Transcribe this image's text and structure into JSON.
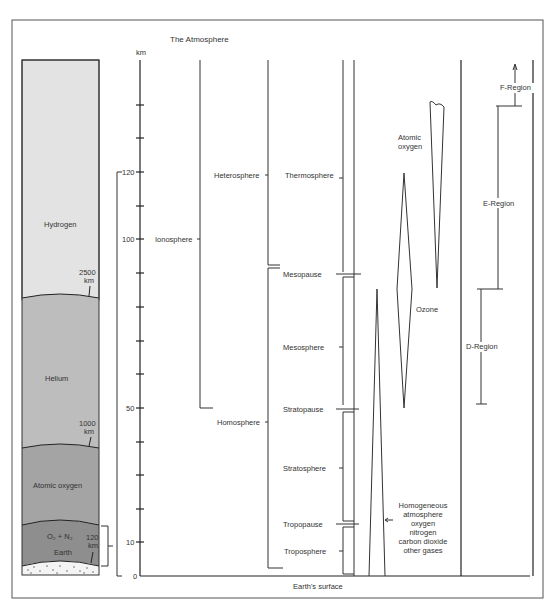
{
  "title": "The Atmosphere",
  "axis": {
    "unit": "km",
    "ticks": [
      {
        "label": "120",
        "y": 172
      },
      {
        "label": "100",
        "y": 239
      },
      {
        "label": "50",
        "y": 408
      },
      {
        "label": "10",
        "y": 542
      },
      {
        "label": "0",
        "y": 576
      }
    ]
  },
  "column_layers": {
    "hydrogen": "Hydrogen",
    "helium": "Helium",
    "atomic_oxygen": "Atomic oxygen",
    "o2_n2": "O₂ + N₂",
    "earth": "Earth",
    "b2500_a": "2500",
    "b2500_b": "km",
    "b1000_a": "1000",
    "b1000_b": "km",
    "b120_a": "120",
    "b120_b": "km"
  },
  "regions": {
    "ionosphere": "Ionosphere",
    "heterosphere": "Heterosphere",
    "homosphere": "Homosphere",
    "thermosphere": "Thermosphere",
    "mesopause": "Mesopause",
    "mesosphere": "Mesosphere",
    "stratopause": "Stratopause",
    "stratosphere": "Stratosphere",
    "tropopause": "Tropopause",
    "troposphere": "Troposphere"
  },
  "composition": {
    "atomic_oxygen_a": "Atomic",
    "atomic_oxygen_b": "oxygen",
    "ozone": "Ozone",
    "homog": [
      "Homogeneous",
      "atmosphere",
      "oxygen",
      "nitrogen",
      "carbon dioxide",
      "other gases"
    ]
  },
  "ionospheric_regions": {
    "f": "F-Region",
    "e": "E-Region",
    "d": "D-Region"
  },
  "footer": "Earth's surface",
  "colors": {
    "hydrogen": "#e3e3e3",
    "helium": "#bdbdbd",
    "atomic_oxygen": "#a4a4a4",
    "o2n2": "#8e8e8e",
    "line": "#333333"
  }
}
